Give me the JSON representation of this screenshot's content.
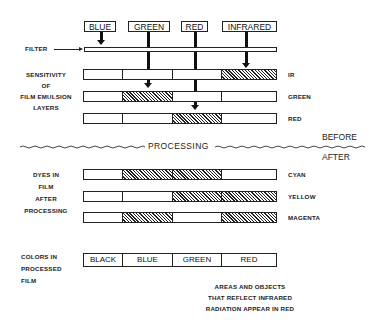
{
  "filters": [
    {
      "label": "BLUE",
      "x": 84,
      "w": 32,
      "line_x": 101
    },
    {
      "label": "GREEN",
      "x": 128,
      "w": 42,
      "line_x": 148
    },
    {
      "label": "RED",
      "x": 181,
      "w": 27,
      "line_x": 195
    },
    {
      "label": "INFRARED",
      "x": 222,
      "w": 55,
      "line_x": 246
    }
  ],
  "labels": {
    "filter": "FILTER",
    "sensitivity_1": "SENSITIVITY",
    "sensitivity_2": "OF",
    "sensitivity_3": "FILM EMULSION",
    "sensitivity_4": "LAYERS",
    "processing": "PROCESSING",
    "before": "BEFORE",
    "after": "AFTER",
    "dyes_1": "DYES IN",
    "dyes_2": "FILM",
    "dyes_3": "AFTER",
    "dyes_4": "PROCESSING",
    "colors_1": "COLORS IN",
    "colors_2": "PROCESSED",
    "colors_3": "FILM",
    "note_1": "AREAS AND OBJECTS",
    "note_2": "THAT REFLECT INFRARED",
    "note_3": "RADIATION APPEAR IN RED"
  },
  "sensitivity_layers": [
    {
      "name": "IR",
      "hatched": [
        false,
        false,
        false,
        true
      ]
    },
    {
      "name": "GREEN",
      "hatched": [
        false,
        true,
        false,
        false
      ]
    },
    {
      "name": "RED",
      "hatched": [
        false,
        false,
        true,
        false
      ]
    }
  ],
  "dye_layers": [
    {
      "name": "CYAN",
      "hatched": [
        false,
        true,
        true,
        false
      ]
    },
    {
      "name": "YELLOW",
      "hatched": [
        false,
        false,
        true,
        true
      ]
    },
    {
      "name": "MAGENTA",
      "hatched": [
        false,
        true,
        false,
        true
      ]
    }
  ],
  "result_colors": [
    "BLACK",
    "BLUE",
    "GREEN",
    "RED"
  ]
}
